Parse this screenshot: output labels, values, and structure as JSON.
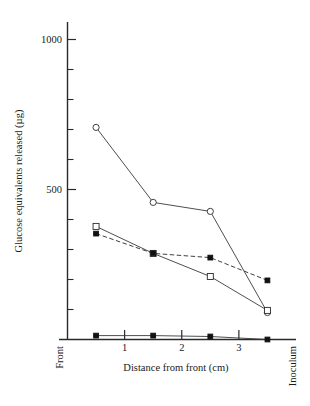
{
  "chart_data": {
    "type": "line",
    "title": "",
    "xlabel": "Distance from front (cm)",
    "ylabel": "Glucose equivalents released (µg)",
    "xlim": [
      0,
      4
    ],
    "ylim": [
      0,
      1060
    ],
    "grid": false,
    "legend": "none",
    "x_tick_labels": [
      "1",
      "2",
      "3"
    ],
    "x_tick_values": [
      1,
      2,
      3
    ],
    "y_tick_labels": [
      "500",
      "1000"
    ],
    "y_tick_values": [
      500,
      1000
    ],
    "y_minor_ticks": [
      550,
      600,
      650,
      700,
      750,
      800,
      850,
      900,
      950,
      450,
      400,
      350,
      300,
      250,
      200,
      150,
      100,
      50
    ],
    "x_axis_start_label": "Front",
    "x_axis_end_label": "Inoculum",
    "x": [
      0.5,
      1.5,
      2.5,
      3.5
    ],
    "series": [
      {
        "name": "open-circle-series",
        "marker": "open-circle",
        "linestyle": "solid",
        "values": [
          707,
          457,
          427,
          90
        ]
      },
      {
        "name": "open-square-series",
        "marker": "open-square",
        "linestyle": "solid",
        "values": [
          377,
          287,
          210,
          97
        ]
      },
      {
        "name": "filled-square-dashed-series",
        "marker": "filled-square",
        "linestyle": "dashed",
        "values": [
          353,
          287,
          273,
          197
        ]
      },
      {
        "name": "filled-square-baseline-series",
        "marker": "filled-square",
        "linestyle": "solid",
        "values": [
          13,
          13,
          10,
          0
        ]
      }
    ],
    "colors": {
      "axis": "#2a2a2a",
      "line": "#3a3a3a",
      "marker_fill_open": "#ffffff",
      "marker_fill_closed": "#111111",
      "background": "#ffffff"
    }
  }
}
